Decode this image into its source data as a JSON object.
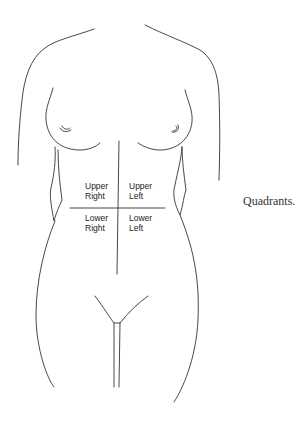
{
  "diagram": {
    "caption": "Quadrants.",
    "quadrants": {
      "upper_right": {
        "line1": "Upper",
        "line2": "Right"
      },
      "upper_left": {
        "line1": "Upper",
        "line2": "Left"
      },
      "lower_right": {
        "line1": "Lower",
        "line2": "Right"
      },
      "lower_left": {
        "line1": "Lower",
        "line2": "Left"
      }
    },
    "colors": {
      "line": "#333333",
      "background": "#ffffff"
    }
  }
}
